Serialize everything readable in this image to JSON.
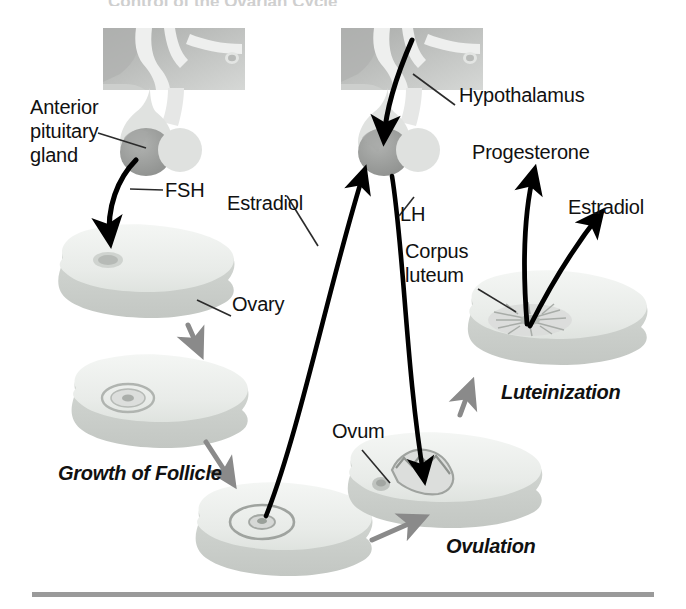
{
  "figure": {
    "title": "Control of the Ovarian Cycle",
    "width": 686,
    "height": 609
  },
  "labels": {
    "anterior_pituitary_line1": "Anterior",
    "anterior_pituitary_line2": "pituitary",
    "anterior_pituitary_line3": "gland",
    "fsh": "FSH",
    "ovary": "Ovary",
    "growth_of_follicle": "Growth of Follicle",
    "estradiol_left": "Estradiol",
    "lh": "LH",
    "hypothalamus": "Hypothalamus",
    "corpus_luteum_line1": "Corpus",
    "corpus_luteum_line2": "luteum",
    "progesterone": "Progesterone",
    "estradiol_right": "Estradiol",
    "luteinization": "Luteinization",
    "ovum": "Ovum",
    "ovulation": "Ovulation"
  },
  "colors": {
    "text": "#111111",
    "arrow_black": "#000000",
    "arrow_gray": "#8a8a8a",
    "leader_line": "#2b2b2b",
    "ovary_fill": "#eceeec",
    "ovary_rim": "#d2d6d2",
    "ovary_shadow": "#c9cdc9",
    "brain_block": "#b6b8b6",
    "brain_light": "#e8e8e8",
    "pituitary_dark": "#9a9a9a",
    "rule": "#9a9a9a",
    "background": "#ffffff"
  },
  "structures": [
    {
      "name": "anterior-pituitary-gland",
      "stage": "pituitary"
    },
    {
      "name": "hypothalamus",
      "stage": "brain"
    },
    {
      "name": "ovary-primordial",
      "stage": "1-resting-follicle"
    },
    {
      "name": "ovary-growing-follicle",
      "stage": "2-growth-of-follicle"
    },
    {
      "name": "ovary-mature-follicle",
      "stage": "3-mature-follicle"
    },
    {
      "name": "ovary-ovulating",
      "stage": "4-ovulation"
    },
    {
      "name": "ovary-corpus-luteum",
      "stage": "5-luteinization"
    }
  ],
  "hormone_flows": [
    {
      "name": "fsh",
      "from": "anterior-pituitary-gland",
      "to": "ovary-primordial"
    },
    {
      "name": "lh",
      "from": "anterior-pituitary-gland",
      "to": "ovary-ovulating"
    },
    {
      "name": "estradiol",
      "from": "ovary-mature-follicle",
      "to": "anterior-pituitary-gland"
    },
    {
      "name": "progesterone",
      "from": "ovary-corpus-luteum",
      "to": "target"
    },
    {
      "name": "estradiol-luteal",
      "from": "ovary-corpus-luteum",
      "to": "target"
    }
  ],
  "cycle_steps": [
    {
      "name": "growth-of-follicle",
      "order": 1
    },
    {
      "name": "maturation",
      "order": 2
    },
    {
      "name": "ovulation",
      "order": 3
    },
    {
      "name": "luteinization",
      "order": 4
    }
  ]
}
